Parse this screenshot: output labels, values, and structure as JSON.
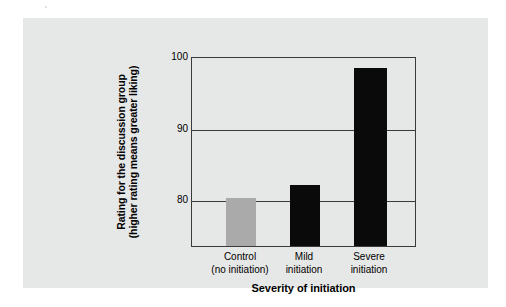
{
  "figure": {
    "panel_background": "#e6e7e7",
    "page_background": "#ffffff",
    "frame_color": "#3a3a3a"
  },
  "chart_data": {
    "type": "bar",
    "title": "",
    "subtitle": "",
    "xlabel": "Severity of initiation",
    "ylabel": "Rating for the discussion group (higher rating means greater liking)",
    "ylabel_lines": [
      "Rating for the discussion group",
      "(higher rating means greater liking)"
    ],
    "categories": [
      "Control\n(no initiation)",
      "Mild\ninitiation",
      "Severe\ninitiation"
    ],
    "category_lines": [
      [
        "Control",
        "(no initiation)"
      ],
      [
        "Mild",
        "initiation"
      ],
      [
        "Severe",
        "initiation"
      ]
    ],
    "values": [
      80.2,
      82.0,
      98.3
    ],
    "bar_colors": [
      "#aaaaab",
      "#0a0a0a",
      "#0a0a0a"
    ],
    "ylim": [
      73.5,
      100
    ],
    "yticks": [
      100,
      90,
      80
    ],
    "ytick_labels": [
      "100",
      "90",
      "80"
    ],
    "grid": true,
    "grid_axis": "y",
    "legend": null,
    "legend_position": "none",
    "annotations": []
  }
}
